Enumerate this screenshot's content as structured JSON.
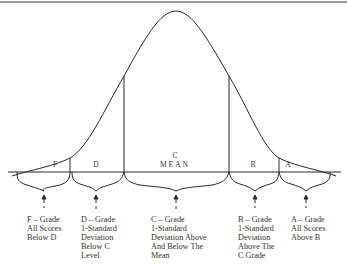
{
  "segments": [
    {
      "grade": "F",
      "label": "F"
    },
    {
      "grade": "D",
      "label": "D"
    },
    {
      "grade": "C",
      "label": "C",
      "sublabel": "MEAN"
    },
    {
      "grade": "B",
      "label": "B"
    },
    {
      "grade": "A",
      "label": "A"
    }
  ],
  "descriptions": [
    {
      "grade": "F",
      "lines": [
        "F – Grade",
        "All Scores",
        "Below D"
      ]
    },
    {
      "grade": "D",
      "lines": [
        "D – Grade",
        "1-Standard",
        "Deviation",
        "Below C",
        "Level"
      ]
    },
    {
      "grade": "C",
      "lines": [
        "C – Grade",
        "1-Standard",
        "Deviation Above",
        "And Below The",
        "Mean"
      ]
    },
    {
      "grade": "B",
      "lines": [
        "B – Grade",
        "1-Standard",
        "Deviation",
        "Above The",
        "C Grade"
      ]
    },
    {
      "grade": "A",
      "lines": [
        "A – Grade",
        "All Scores",
        "Above B"
      ]
    }
  ],
  "colors": {
    "line": "#2a2a2a",
    "border": "#9a9a9a",
    "background": "#ffffff"
  }
}
